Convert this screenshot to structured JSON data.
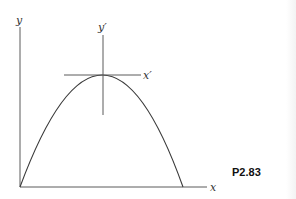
{
  "figure": {
    "problem_label": "P2.83",
    "axes": {
      "y_label": "y",
      "x_label": "x",
      "y_prime_label": "y′",
      "x_prime_label": "x′"
    },
    "curve": {
      "type": "parabola",
      "description": "downward-opening parabola starting at origin, vertex at top where x′–y′ axes cross",
      "opens": "down"
    },
    "colors": {
      "line": "#3a3a3a",
      "background": "#ffffff"
    }
  }
}
